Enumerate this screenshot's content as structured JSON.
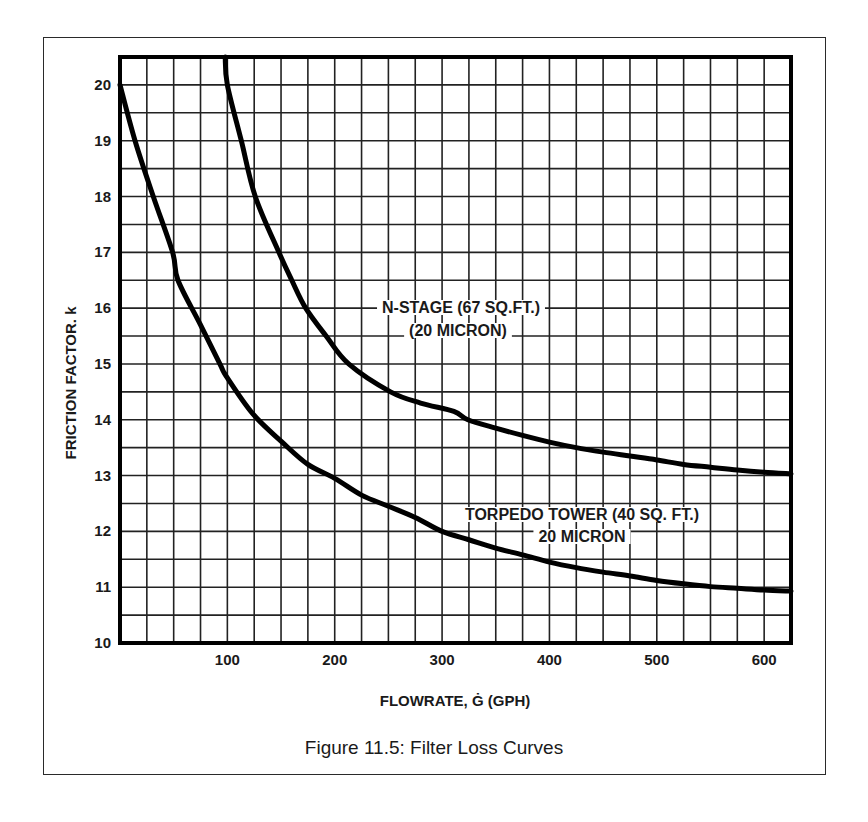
{
  "caption": "Figure 11.5:  Filter Loss Curves",
  "chart_data": {
    "type": "line",
    "title": "Figure 11.5:  Filter Loss Curves",
    "xlabel": "FLOWRATE, Ġ (GPH)",
    "ylabel": "FRICTION FACTOR. k",
    "xlim": [
      0,
      625
    ],
    "ylim": [
      10,
      20.5
    ],
    "x_ticks": [
      100,
      200,
      300,
      400,
      500,
      600
    ],
    "x_tick_labels": [
      "100",
      "200",
      "300",
      "400",
      "500",
      "600"
    ],
    "y_ticks": [
      10,
      11,
      12,
      13,
      14,
      15,
      16,
      17,
      18,
      19,
      20
    ],
    "y_tick_labels": [
      "10",
      "11",
      "12",
      "13",
      "14",
      "15",
      "16",
      "17",
      "18",
      "19",
      "20"
    ],
    "grid": true,
    "grid_x_step": 25,
    "grid_y_step": 0.5,
    "series": [
      {
        "name": "N-STAGE (67 SQ.FT.) (20 MICRON)",
        "label_lines": [
          "N-STAGE (67 SQ.FT.)",
          "(20 MICRON)"
        ],
        "x": [
          98,
          100,
          113,
          126,
          148,
          160,
          173,
          192,
          213,
          252,
          280,
          311,
          324,
          350,
          375,
          400,
          425,
          450,
          475,
          500,
          525,
          550,
          575,
          600,
          625
        ],
        "y": [
          20.5,
          20.0,
          19.0,
          18.0,
          17.0,
          16.5,
          16.0,
          15.5,
          15.0,
          14.5,
          14.3,
          14.15,
          14.0,
          13.85,
          13.72,
          13.6,
          13.5,
          13.42,
          13.35,
          13.28,
          13.2,
          13.15,
          13.1,
          13.06,
          13.03
        ]
      },
      {
        "name": "TORPEDO TOWER (40 SQ. FT.) 20 MICRON",
        "label_lines": [
          "TORPEDO TOWER (40 SQ. FT.)",
          "20 MICRON"
        ],
        "x": [
          0,
          14,
          31,
          49,
          54,
          75,
          93,
          100,
          124,
          151,
          175,
          200,
          225,
          250,
          275,
          300,
          325,
          350,
          375,
          400,
          425,
          450,
          475,
          500,
          525,
          550,
          575,
          600,
          625
        ],
        "y": [
          20.0,
          19.0,
          18.0,
          17.0,
          16.5,
          15.7,
          15.0,
          14.75,
          14.1,
          13.6,
          13.2,
          12.95,
          12.65,
          12.45,
          12.25,
          12.0,
          11.85,
          11.7,
          11.58,
          11.45,
          11.35,
          11.27,
          11.2,
          11.12,
          11.06,
          11.01,
          10.98,
          10.95,
          10.93
        ]
      }
    ]
  }
}
